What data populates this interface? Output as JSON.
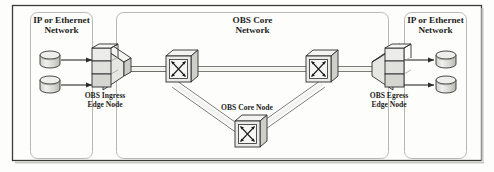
{
  "figure": {
    "kind": "network-architecture-diagram",
    "title_visible": false
  },
  "zones": [
    {
      "id": "left-access-network",
      "label_line1": "IP or Ethernet",
      "label_line2": "Network",
      "x": 30,
      "y": 12,
      "w": 62,
      "h": 146
    },
    {
      "id": "obs-core-network",
      "label_line1": "OBS Core",
      "label_line2": "Network",
      "x": 116,
      "y": 12,
      "w": 272,
      "h": 146
    },
    {
      "id": "right-access-network",
      "label_line1": "IP or Ethernet",
      "label_line2": "Network",
      "x": 404,
      "y": 12,
      "w": 62,
      "h": 146
    }
  ],
  "nodes": [
    {
      "id": "ingress-edge-node",
      "type": "edge-node",
      "orientation": "ingress",
      "label_line1": "OBS Ingress",
      "label_line2": "Edge Node",
      "cx": 108,
      "cy": 66
    },
    {
      "id": "core-node-left",
      "type": "core-switch",
      "label_line1": "",
      "label_line2": "",
      "cx": 178,
      "cy": 70
    },
    {
      "id": "core-node-right",
      "type": "core-switch",
      "label_line1": "",
      "label_line2": "",
      "cx": 318,
      "cy": 70
    },
    {
      "id": "core-node-bottom",
      "type": "core-switch",
      "label_line1": "OBS Core Node",
      "label_line2": "",
      "cx": 247,
      "cy": 127
    },
    {
      "id": "egress-edge-node",
      "type": "edge-node",
      "orientation": "egress",
      "label_line1": "OBS Egress",
      "label_line2": "Edge Node",
      "cx": 388,
      "cy": 66
    }
  ],
  "hosts": [
    {
      "id": "left-host-top",
      "cx": 50,
      "cy": 59
    },
    {
      "id": "left-host-bottom",
      "cx": 50,
      "cy": 84
    },
    {
      "id": "right-host-top",
      "cx": 446,
      "cy": 59
    },
    {
      "id": "right-host-bottom",
      "cx": 446,
      "cy": 84
    }
  ],
  "links": [
    {
      "id": "host-link-left-top",
      "style": "single-arrow"
    },
    {
      "id": "host-link-left-bottom",
      "style": "single-arrow"
    },
    {
      "id": "host-link-right-top",
      "style": "single-arrow"
    },
    {
      "id": "host-link-right-bottom",
      "style": "single-arrow"
    },
    {
      "id": "trunk-ingress-to-core-left",
      "style": "double-fiber"
    },
    {
      "id": "trunk-core-left-to-core-right",
      "style": "double-fiber"
    },
    {
      "id": "trunk-core-right-to-egress",
      "style": "double-fiber"
    },
    {
      "id": "trunk-core-left-to-bottom",
      "style": "double-fiber"
    },
    {
      "id": "trunk-bottom-to-core-right",
      "style": "double-fiber"
    }
  ],
  "colors": {
    "frame": "#3a3a38",
    "zone_outline": "#b9b9b4",
    "node_stroke": "#2c2c2a",
    "node_fill_top": "#f3f3f1",
    "node_fill_front": "#e3e3df",
    "node_fill_side": "#cfcfc9",
    "link": "#8e8e88",
    "text": "#1d1d1b",
    "background": "#fdfdfc"
  },
  "labels": {
    "left_network": "IP or Ethernet Network",
    "core_network": "OBS Core Network",
    "right_network": "IP or Ethernet Network",
    "ingress": "OBS Ingress Edge Node",
    "egress": "OBS Egress Edge Node",
    "core_node": "OBS Core Node"
  }
}
